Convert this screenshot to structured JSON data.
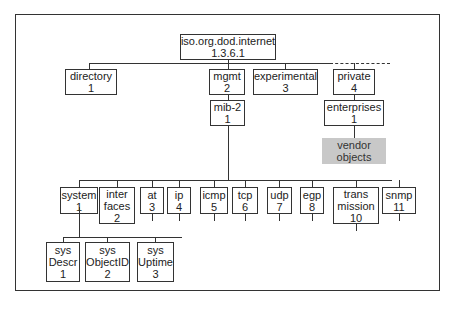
{
  "root": {
    "name": "iso.org.dod.internet",
    "oid": "1.3.6.1"
  },
  "level1": [
    {
      "name": "directory",
      "num": "1"
    },
    {
      "name": "mgmt",
      "num": "2"
    },
    {
      "name": "experimental",
      "num": "3"
    },
    {
      "name": "private",
      "num": "4"
    }
  ],
  "mib2": {
    "name": "mib-2",
    "num": "1"
  },
  "enterprises": {
    "name": "enterprises",
    "num": "1"
  },
  "vendor": {
    "line1": "vendor",
    "line2": "objects"
  },
  "groups": [
    {
      "l1": "system",
      "l2": "1",
      "l3": ""
    },
    {
      "l1": "inter",
      "l2": "faces",
      "l3": "2"
    },
    {
      "l1": "at",
      "l2": "3",
      "l3": ""
    },
    {
      "l1": "ip",
      "l2": "4",
      "l3": ""
    },
    {
      "l1": "icmp",
      "l2": "5",
      "l3": ""
    },
    {
      "l1": "tcp",
      "l2": "6",
      "l3": ""
    },
    {
      "l1": "udp",
      "l2": "7",
      "l3": ""
    },
    {
      "l1": "egp",
      "l2": "8",
      "l3": ""
    },
    {
      "l1": "trans",
      "l2": "mission",
      "l3": "10"
    },
    {
      "l1": "snmp",
      "l2": "11",
      "l3": ""
    }
  ],
  "system_children": [
    {
      "l1": "sys",
      "l2": "Descr",
      "l3": "1"
    },
    {
      "l1": "sys",
      "l2": "ObjectID",
      "l3": "2"
    },
    {
      "l1": "sys",
      "l2": "Uptime",
      "l3": "3"
    }
  ]
}
